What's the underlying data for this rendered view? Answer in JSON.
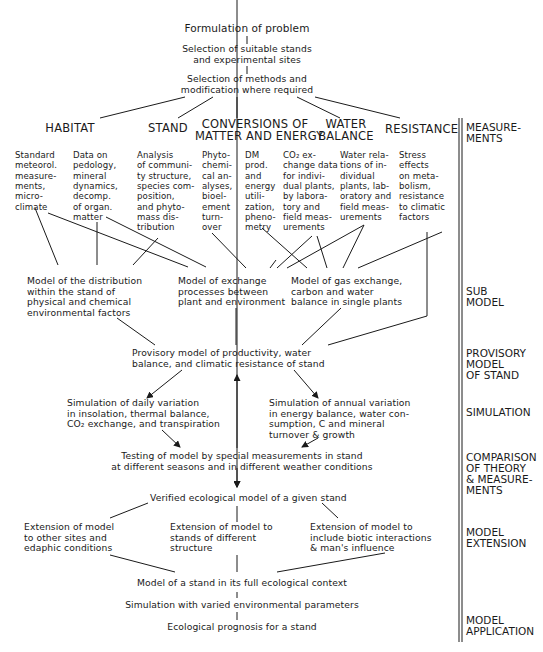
{
  "header": {
    "problem": "Formulation of problem",
    "selection_stands": "Selection of suitable stands\nand experimental sites",
    "selection_methods": "Selection of methods and\nmodification where required"
  },
  "categories": [
    {
      "title": "HABITAT"
    },
    {
      "title": "STAND"
    },
    {
      "title": "CONVERSIONS OF\nMATTER AND ENERGY"
    },
    {
      "title": "WATER\nBALANCE"
    },
    {
      "title": "RESISTANCE"
    }
  ],
  "measurements": [
    {
      "text": "Standard\nmeteorol.\nmeasure-\nments,\nmicro-\nclimate"
    },
    {
      "text": "Data on\npedology,\nmineral\ndynamics,\ndecomp.\nof organ.\nmatter"
    },
    {
      "text": "Analysis\nof communi-\nty structure,\nspecies com-\nposition,\nand phyto-\nmass dis-\ntribution"
    },
    {
      "text": "Phyto-\nchemi-\ncal an-\nalyses,\nbioel-\nement\nturn-\nover"
    },
    {
      "text": "DM\nprod.\nand\nenergy\nutili-\nzation,\npheno-\nmetry"
    },
    {
      "text": "CO₂ ex-\nchange data\nfor indivi-\ndual plants,\nby labora-\ntory and\nfield meas-\nurements"
    },
    {
      "text": "Water rela-\ntions of in-\ndividual\nplants, lab-\noratory and\nfield meas-\nurements"
    },
    {
      "text": "Stress\neffects\non meta-\nbolism,\nresistance\nto climatic\nfactors"
    }
  ],
  "submodels": [
    {
      "text": "Model of the distribution\nwithin the stand of\nphysical and chemical\nenvironmental factors"
    },
    {
      "text": "Model of exchange\nprocesses between\nplant and environment"
    },
    {
      "text": "Model of gas exchange,\ncarbon and water\nbalance in single plants"
    }
  ],
  "provisory_model": "Provisory model of productivity, water\nbalance, and climatic resistance of stand",
  "simulations": [
    {
      "text": "Simulation of daily variation\nin insolation, thermal balance,\nCO₂ exchange, and transpiration"
    },
    {
      "text": "Simulation of annual variation\nin energy balance, water con-\nsumption, C and mineral\nturnover & growth"
    }
  ],
  "testing": "Testing of model by special measurements in stand\nat different seasons and in different weather conditions",
  "verified": "Verified ecological model of a given stand",
  "extensions": [
    {
      "text": "Extension of model\nto other sites and\nedaphic conditions"
    },
    {
      "text": "Extension of model to\nstands of different\nstructure"
    },
    {
      "text": "Extension of model to\ninclude biotic interactions\n& man's influence"
    }
  ],
  "full_context": "Model of a stand in its full ecological context",
  "simulation_varied": "Simulation with varied environmental parameters",
  "prognosis": "Ecological prognosis for a stand",
  "side_labels": [
    {
      "text": "MEASURE-\nMENTS"
    },
    {
      "text": "SUB\nMODEL"
    },
    {
      "text": "PROVISORY\nMODEL\nOF STAND"
    },
    {
      "text": "SIMULATION"
    },
    {
      "text": "COMPARISON\nOF THEORY\n& MEASURE-\nMENTS"
    },
    {
      "text": "MODEL\nEXTENSION"
    },
    {
      "text": "MODEL\nAPPLICATION"
    }
  ],
  "colors": {
    "ink": "#1a1a1a",
    "background": "#ffffff"
  }
}
